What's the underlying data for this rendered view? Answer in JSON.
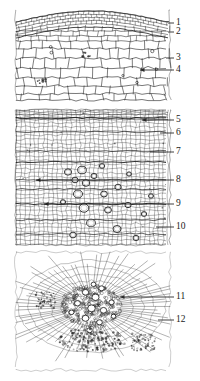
{
  "figure": {
    "kind": "botanical-micrograph",
    "background_color": "#ffffff",
    "ink_color": "#1f1f1f",
    "panels": [
      {
        "id": "panel-top",
        "name": "periderm-and-cortex",
        "x": 16,
        "y": 8,
        "width": 154,
        "height": 96
      },
      {
        "id": "panel-middle",
        "name": "secondary-xylem-with-vessels",
        "x": 16,
        "y": 110,
        "width": 154,
        "height": 135
      },
      {
        "id": "panel-bottom",
        "name": "vascular-bundle",
        "x": 16,
        "y": 252,
        "width": 154,
        "height": 118
      }
    ],
    "labels": [
      {
        "id": 1,
        "text": "1",
        "x": 176,
        "y": 18,
        "leader_from_x": 168,
        "leader_to_x": 174,
        "leader_y": 23,
        "panel": "panel-top"
      },
      {
        "id": 2,
        "text": "2",
        "x": 176,
        "y": 27,
        "leader_from_x": 168,
        "leader_to_x": 174,
        "leader_y": 32,
        "panel": "panel-top"
      },
      {
        "id": 3,
        "text": "3",
        "x": 176,
        "y": 53,
        "leader_from_x": 166,
        "leader_to_x": 174,
        "leader_y": 58,
        "panel": "panel-top"
      },
      {
        "id": 4,
        "text": "4",
        "x": 176,
        "y": 65,
        "leader_from_x": 140,
        "leader_to_x": 174,
        "leader_y": 70,
        "panel": "panel-top"
      },
      {
        "id": 5,
        "text": "5",
        "x": 176,
        "y": 115,
        "leader_from_x": 142,
        "leader_to_x": 174,
        "leader_y": 120,
        "panel": "panel-middle"
      },
      {
        "id": 6,
        "text": "6",
        "x": 176,
        "y": 128,
        "leader_from_x": 160,
        "leader_to_x": 174,
        "leader_y": 133,
        "panel": "panel-middle"
      },
      {
        "id": 7,
        "text": "7",
        "x": 176,
        "y": 147,
        "leader_from_x": 150,
        "leader_to_x": 174,
        "leader_y": 152,
        "panel": "panel-middle"
      },
      {
        "id": 8,
        "text": "8",
        "x": 176,
        "y": 175,
        "leader_from_x": 36,
        "leader_to_x": 174,
        "leader_y": 180,
        "panel": "panel-middle"
      },
      {
        "id": 9,
        "text": "9",
        "x": 176,
        "y": 199,
        "leader_from_x": 44,
        "leader_to_x": 174,
        "leader_y": 204,
        "panel": "panel-middle"
      },
      {
        "id": 10,
        "text": "10",
        "x": 176,
        "y": 222,
        "leader_from_x": 156,
        "leader_to_x": 174,
        "leader_y": 227,
        "panel": "panel-middle"
      },
      {
        "id": 11,
        "text": "11",
        "x": 176,
        "y": 292,
        "leader_from_x": 120,
        "leader_to_x": 174,
        "leader_y": 297,
        "panel": "panel-bottom"
      },
      {
        "id": 12,
        "text": "12",
        "x": 176,
        "y": 315,
        "leader_from_x": 158,
        "leader_to_x": 174,
        "leader_y": 320,
        "panel": "panel-bottom"
      }
    ]
  }
}
